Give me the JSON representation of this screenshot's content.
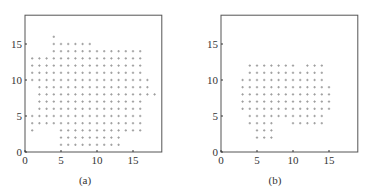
{
  "chart_data": [
    {
      "type": "scatter",
      "caption": "(a)",
      "xlim": [
        0,
        19
      ],
      "ylim": [
        0,
        19
      ],
      "xticks": [
        0,
        5,
        10,
        15
      ],
      "yticks": [
        0,
        5,
        10,
        15
      ],
      "marker_color": "#9a9a9a",
      "grid": false,
      "rows": [
        {
          "y": 16,
          "x": [
            4
          ]
        },
        {
          "y": 15,
          "x": [
            4,
            5,
            6,
            7,
            8,
            9
          ]
        },
        {
          "y": 14,
          "x": [
            4,
            5,
            6,
            7,
            8,
            9,
            10,
            11,
            12,
            13,
            14,
            15,
            16
          ]
        },
        {
          "y": 13,
          "x": [
            1,
            2,
            3,
            4,
            5,
            6,
            7,
            8,
            9,
            10,
            11,
            12,
            13,
            14,
            15,
            16
          ]
        },
        {
          "y": 12,
          "x": [
            1,
            2,
            3,
            4,
            5,
            6,
            7,
            8,
            9,
            10,
            11,
            12,
            13,
            14,
            15,
            16
          ]
        },
        {
          "y": 11,
          "x": [
            1,
            2,
            3,
            4,
            5,
            6,
            7,
            8,
            9,
            10,
            11,
            12,
            13,
            14,
            15,
            16
          ]
        },
        {
          "y": 10,
          "x": [
            1,
            2,
            3,
            4,
            5,
            6,
            7,
            8,
            9,
            10,
            11,
            12,
            13,
            14,
            15,
            16,
            17
          ]
        },
        {
          "y": 9,
          "x": [
            2,
            3,
            4,
            5,
            6,
            7,
            8,
            9,
            10,
            11,
            12,
            13,
            14,
            15,
            16,
            17
          ]
        },
        {
          "y": 8,
          "x": [
            2,
            3,
            4,
            5,
            6,
            7,
            8,
            9,
            10,
            11,
            12,
            13,
            14,
            15,
            16,
            17,
            18
          ]
        },
        {
          "y": 7,
          "x": [
            2,
            3,
            4,
            5,
            6,
            7,
            8,
            9,
            10,
            11,
            12,
            13,
            14,
            15,
            16
          ]
        },
        {
          "y": 6,
          "x": [
            2,
            3,
            4,
            5,
            6,
            7,
            8,
            9,
            10,
            11,
            12,
            13,
            14,
            15,
            16
          ]
        },
        {
          "y": 5,
          "x": [
            1,
            2,
            3,
            4,
            5,
            6,
            7,
            8,
            9,
            10,
            11,
            12,
            13,
            14,
            15,
            16
          ]
        },
        {
          "y": 4,
          "x": [
            1,
            2,
            3,
            4,
            5,
            6,
            7,
            8,
            9,
            10,
            11,
            12,
            13,
            14,
            15,
            16
          ]
        },
        {
          "y": 3,
          "x": [
            1,
            5,
            6,
            7,
            8,
            9,
            10,
            11,
            12,
            13,
            14,
            15,
            16
          ]
        },
        {
          "y": 2,
          "x": [
            5,
            6,
            7,
            8,
            9,
            10,
            11,
            12,
            13
          ]
        },
        {
          "y": 1,
          "x": [
            5,
            6,
            7,
            8,
            9,
            10,
            11,
            12,
            13
          ]
        }
      ]
    },
    {
      "type": "scatter",
      "caption": "(b)",
      "xlim": [
        0,
        19
      ],
      "ylim": [
        0,
        19
      ],
      "xticks": [
        0,
        5,
        10,
        15
      ],
      "yticks": [
        0,
        5,
        10,
        15
      ],
      "marker_color": "#9a9a9a",
      "grid": false,
      "rows": [
        {
          "y": 12,
          "x": [
            4,
            5,
            6,
            7,
            8,
            9,
            10,
            12,
            13,
            14
          ]
        },
        {
          "y": 11,
          "x": [
            4,
            5,
            6,
            7,
            8,
            9,
            10,
            11,
            12,
            13,
            14
          ]
        },
        {
          "y": 10,
          "x": [
            3,
            4,
            5,
            6,
            7,
            8,
            9,
            10,
            11,
            12,
            13,
            14
          ]
        },
        {
          "y": 9,
          "x": [
            3,
            4,
            5,
            6,
            7,
            8,
            9,
            10,
            11,
            12,
            13,
            14,
            15
          ]
        },
        {
          "y": 8,
          "x": [
            3,
            4,
            5,
            6,
            7,
            8,
            9,
            10,
            11,
            12,
            13,
            14,
            15
          ]
        },
        {
          "y": 7,
          "x": [
            3,
            4,
            5,
            6,
            7,
            8,
            9,
            10,
            11,
            12,
            13,
            14,
            15
          ]
        },
        {
          "y": 6,
          "x": [
            3,
            4,
            5,
            6,
            7,
            8,
            9,
            10,
            11,
            12,
            13,
            14,
            15
          ]
        },
        {
          "y": 5,
          "x": [
            4,
            5,
            6,
            7,
            8,
            9,
            10,
            11,
            12,
            13,
            14
          ]
        },
        {
          "y": 4,
          "x": [
            4,
            5,
            6,
            7,
            10,
            11,
            12,
            13,
            14
          ]
        },
        {
          "y": 3,
          "x": [
            5,
            6,
            7
          ]
        },
        {
          "y": 2,
          "x": [
            5,
            6,
            7
          ]
        }
      ]
    }
  ]
}
